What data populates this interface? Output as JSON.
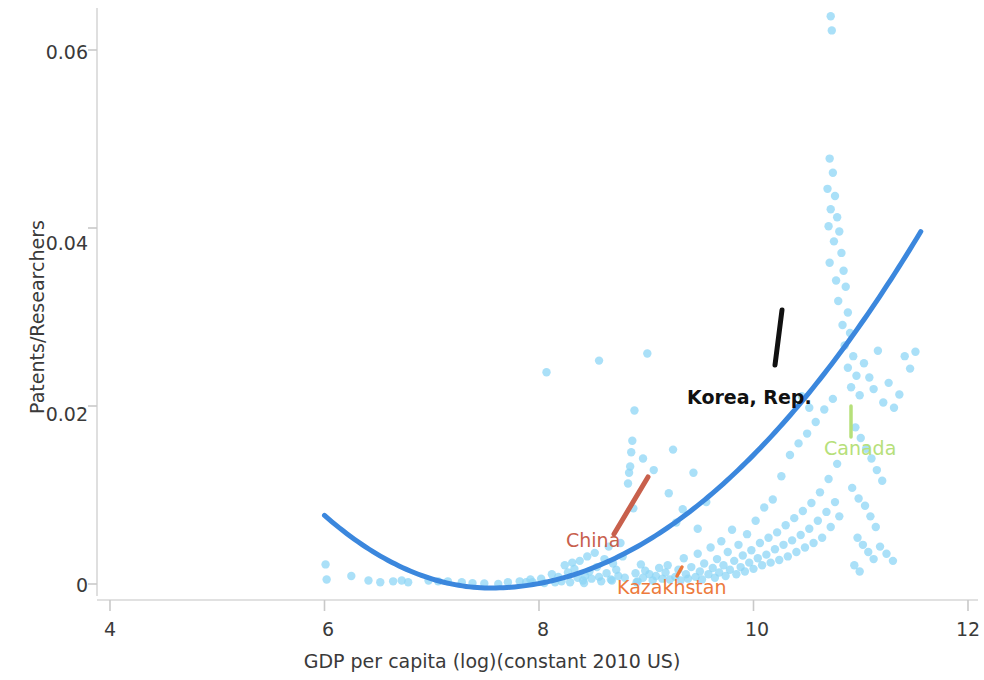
{
  "chart_data": {
    "type": "scatter",
    "title": "",
    "xlabel": "GDP per capita (log)(constant 2010 US)",
    "ylabel": "Patents/Researchers",
    "xlim": [
      4,
      12
    ],
    "ylim": [
      -0.0035,
      0.0665
    ],
    "xticks": [
      4,
      6,
      8,
      10,
      12
    ],
    "xtick_labels": [
      "4",
      "6",
      "8",
      "10",
      "12"
    ],
    "yticks": [
      0,
      0.02,
      0.04,
      0.06
    ],
    "ytick_labels": [
      "0",
      "0.02",
      "0.04",
      "0.06"
    ],
    "grid": false,
    "legend": "none",
    "point_color": "#8ed6f5",
    "point_opacity": 0.75,
    "point_radius": 4.2,
    "trend_color": "#3b87dd",
    "trend_width": 5,
    "points": [
      [
        6.01,
        0.0022
      ],
      [
        6.02,
        0.0005
      ],
      [
        6.52,
        0.0002
      ],
      [
        6.64,
        0.0003
      ],
      [
        6.72,
        0.0004
      ],
      [
        6.78,
        0.0002
      ],
      [
        6.97,
        0.0004
      ],
      [
        7.06,
        0.0003
      ],
      [
        7.28,
        0.0002
      ],
      [
        7.38,
        0.0001
      ],
      [
        7.49,
        5e-05
      ],
      [
        7.62,
        0.0
      ],
      [
        7.71,
        0.0002
      ],
      [
        7.82,
        0.0003
      ],
      [
        7.88,
        0.0002
      ],
      [
        7.94,
        0.0002
      ],
      [
        8.02,
        0.0006
      ],
      [
        8.05,
        0.0001
      ],
      [
        8.12,
        0.0011
      ],
      [
        8.18,
        0.0008
      ],
      [
        8.21,
        0.0003
      ],
      [
        8.24,
        0.0021
      ],
      [
        8.27,
        0.0013
      ],
      [
        8.29,
        0.0002
      ],
      [
        8.31,
        0.0024
      ],
      [
        8.33,
        0.0017
      ],
      [
        8.36,
        0.0007
      ],
      [
        8.38,
        0.0026
      ],
      [
        8.41,
        0.0004
      ],
      [
        8.43,
        0.0009
      ],
      [
        8.45,
        0.0031
      ],
      [
        8.47,
        0.0014
      ],
      [
        8.49,
        0.0006
      ],
      [
        8.52,
        0.0035
      ],
      [
        8.54,
        0.0019
      ],
      [
        8.56,
        0.0008
      ],
      [
        8.58,
        0.0003
      ],
      [
        8.61,
        0.0028
      ],
      [
        8.63,
        0.0012
      ],
      [
        8.65,
        0.0042
      ],
      [
        8.67,
        0.0005
      ],
      [
        8.69,
        0.0023
      ],
      [
        8.72,
        0.0016
      ],
      [
        8.74,
        0.0009
      ],
      [
        8.76,
        0.0046
      ],
      [
        8.78,
        0.0031
      ],
      [
        8.8,
        0.0007
      ],
      [
        8.83,
        0.0113
      ],
      [
        8.84,
        0.0125
      ],
      [
        8.85,
        0.0132
      ],
      [
        8.86,
        0.0148
      ],
      [
        8.87,
        0.0161
      ],
      [
        8.88,
        0.0085
      ],
      [
        8.89,
        0.0195
      ],
      [
        8.9,
        0.0012
      ],
      [
        8.92,
        0.0003
      ],
      [
        8.95,
        0.0022
      ],
      [
        8.97,
        0.0007
      ],
      [
        8.99,
        0.0015
      ],
      [
        9.01,
        0.0259
      ],
      [
        9.03,
        0.0011
      ],
      [
        9.06,
        0.0004
      ],
      [
        9.09,
        0.0009
      ],
      [
        9.12,
        0.0018
      ],
      [
        9.15,
        0.0006
      ],
      [
        9.18,
        0.0013
      ],
      [
        9.2,
        0.0021
      ],
      [
        9.22,
        0.0005
      ],
      [
        9.25,
        0.0151
      ],
      [
        9.27,
        0.0008
      ],
      [
        9.3,
        0.0016
      ],
      [
        9.32,
        0.0004
      ],
      [
        9.35,
        0.0029
      ],
      [
        9.37,
        0.0011
      ],
      [
        9.39,
        0.0006
      ],
      [
        9.42,
        0.0019
      ],
      [
        9.44,
        0.0125
      ],
      [
        9.46,
        0.0008
      ],
      [
        9.48,
        0.0034
      ],
      [
        9.5,
        0.0014
      ],
      [
        9.52,
        0.0005
      ],
      [
        9.54,
        0.0023
      ],
      [
        9.56,
        0.0092
      ],
      [
        9.58,
        0.0011
      ],
      [
        9.6,
        0.0041
      ],
      [
        9.62,
        0.0018
      ],
      [
        9.64,
        0.0007
      ],
      [
        9.66,
        0.0028
      ],
      [
        9.68,
        0.0013
      ],
      [
        9.7,
        0.0048
      ],
      [
        9.72,
        0.0021
      ],
      [
        9.74,
        0.0009
      ],
      [
        9.76,
        0.0036
      ],
      [
        9.78,
        0.0016
      ],
      [
        9.8,
        0.0061
      ],
      [
        9.82,
        0.0026
      ],
      [
        9.84,
        0.0011
      ],
      [
        9.86,
        0.0044
      ],
      [
        9.88,
        0.0019
      ],
      [
        9.9,
        0.0032
      ],
      [
        9.92,
        0.0014
      ],
      [
        9.94,
        0.0056
      ],
      [
        9.96,
        0.0024
      ],
      [
        9.98,
        0.0038
      ],
      [
        10.0,
        0.0017
      ],
      [
        10.02,
        0.0071
      ],
      [
        10.04,
        0.0029
      ],
      [
        10.06,
        0.0046
      ],
      [
        10.08,
        0.0021
      ],
      [
        10.1,
        0.0086
      ],
      [
        10.12,
        0.0033
      ],
      [
        10.14,
        0.0052
      ],
      [
        10.16,
        0.0024
      ],
      [
        10.18,
        0.0095
      ],
      [
        10.2,
        0.0039
      ],
      [
        10.22,
        0.0058
      ],
      [
        10.24,
        0.0027
      ],
      [
        10.26,
        0.0121
      ],
      [
        10.28,
        0.0044
      ],
      [
        10.3,
        0.0066
      ],
      [
        10.32,
        0.0031
      ],
      [
        10.34,
        0.0145
      ],
      [
        10.36,
        0.0049
      ],
      [
        10.38,
        0.0074
      ],
      [
        10.4,
        0.0036
      ],
      [
        10.42,
        0.0158
      ],
      [
        10.44,
        0.0055
      ],
      [
        10.46,
        0.0082
      ],
      [
        10.48,
        0.0041
      ],
      [
        10.5,
        0.0169
      ],
      [
        10.52,
        0.0062
      ],
      [
        10.54,
        0.0091
      ],
      [
        10.56,
        0.0046
      ],
      [
        10.58,
        0.0182
      ],
      [
        10.6,
        0.0071
      ],
      [
        10.62,
        0.0103
      ],
      [
        10.64,
        0.0052
      ],
      [
        10.66,
        0.0196
      ],
      [
        10.68,
        0.0081
      ],
      [
        10.7,
        0.0118
      ],
      [
        10.72,
        0.0064
      ],
      [
        10.74,
        0.0208
      ],
      [
        10.76,
        0.0092
      ],
      [
        10.78,
        0.0135
      ],
      [
        10.8,
        0.0076
      ],
      [
        10.72,
        0.0638
      ],
      [
        10.73,
        0.0622
      ],
      [
        10.71,
        0.0478
      ],
      [
        10.74,
        0.0462
      ],
      [
        10.69,
        0.0444
      ],
      [
        10.76,
        0.0436
      ],
      [
        10.72,
        0.0421
      ],
      [
        10.78,
        0.0412
      ],
      [
        10.7,
        0.0402
      ],
      [
        10.8,
        0.0396
      ],
      [
        10.75,
        0.0385
      ],
      [
        10.82,
        0.0372
      ],
      [
        10.71,
        0.0361
      ],
      [
        10.84,
        0.0352
      ],
      [
        10.77,
        0.0341
      ],
      [
        10.86,
        0.0334
      ],
      [
        10.79,
        0.0318
      ],
      [
        10.88,
        0.0305
      ],
      [
        10.83,
        0.0291
      ],
      [
        10.9,
        0.0282
      ],
      [
        10.85,
        0.0268
      ],
      [
        10.93,
        0.0256
      ],
      [
        10.88,
        0.0243
      ],
      [
        10.96,
        0.0234
      ],
      [
        10.91,
        0.0221
      ],
      [
        10.99,
        0.0212
      ],
      [
        11.03,
        0.0248
      ],
      [
        11.08,
        0.0232
      ],
      [
        11.12,
        0.0219
      ],
      [
        11.16,
        0.0262
      ],
      [
        11.21,
        0.0204
      ],
      [
        11.26,
        0.0226
      ],
      [
        11.31,
        0.0198
      ],
      [
        11.36,
        0.0213
      ],
      [
        11.41,
        0.0256
      ],
      [
        11.46,
        0.0242
      ],
      [
        11.51,
        0.0261
      ],
      [
        10.95,
        0.0176
      ],
      [
        11.0,
        0.0164
      ],
      [
        11.05,
        0.0152
      ],
      [
        11.1,
        0.0141
      ],
      [
        11.15,
        0.0128
      ],
      [
        11.2,
        0.0116
      ],
      [
        10.92,
        0.0108
      ],
      [
        10.98,
        0.0096
      ],
      [
        11.04,
        0.0088
      ],
      [
        11.09,
        0.0076
      ],
      [
        11.14,
        0.0064
      ],
      [
        10.97,
        0.0052
      ],
      [
        11.02,
        0.0044
      ],
      [
        11.07,
        0.0036
      ],
      [
        11.12,
        0.0028
      ],
      [
        10.94,
        0.0021
      ],
      [
        10.99,
        0.0014
      ],
      [
        11.18,
        0.0042
      ],
      [
        11.24,
        0.0034
      ],
      [
        11.3,
        0.0026
      ],
      [
        8.07,
        0.0238
      ],
      [
        8.56,
        0.0251
      ],
      [
        9.34,
        0.0084
      ],
      [
        9.48,
        0.0062
      ],
      [
        9.28,
        0.0069
      ],
      [
        9.21,
        0.0102
      ],
      [
        9.07,
        0.0128
      ],
      [
        8.97,
        0.0141
      ],
      [
        10.45,
        0.0211
      ],
      [
        10.52,
        0.0198
      ],
      [
        6.25,
        0.0009
      ],
      [
        6.41,
        0.0004
      ],
      [
        7.15,
        0.0003
      ],
      [
        7.92,
        0.0005
      ],
      [
        8.15,
        0.0002
      ],
      [
        8.42,
        0.0001
      ],
      [
        8.68,
        0.0004
      ],
      [
        8.91,
        0.0002
      ]
    ],
    "trend_curve": {
      "description": "fitted quadratic trend line",
      "x_start": 6.0,
      "x_end": 11.56,
      "y_start": 0.0077,
      "y_min": -0.00045,
      "x_min": 7.55,
      "y_end": 0.0396,
      "color": "#3b87dd"
    },
    "annotations": [
      {
        "name": "China",
        "label": "China",
        "color": "#c8604c",
        "label_x": 566,
        "label_y": 529,
        "line": {
          "x1": 614,
          "y1": 534,
          "x2": 648,
          "y2": 477
        }
      },
      {
        "name": "Kazakhstan",
        "label": "Kazakhstan",
        "color": "#ed7a3c",
        "label_x": 617,
        "label_y": 576,
        "line": {
          "x1": 677,
          "y1": 576,
          "x2": 682,
          "y2": 567
        }
      },
      {
        "name": "Korea, Rep.",
        "label": "Korea, Rep.",
        "color": "#111111",
        "label_x": 687,
        "label_y": 386,
        "line": {
          "x1": 775,
          "y1": 365,
          "x2": 782,
          "y2": 310
        }
      },
      {
        "name": "Canada",
        "label": "Canada",
        "color": "#b6e07a",
        "label_x": 824,
        "label_y": 437,
        "line": {
          "x1": 851,
          "y1": 437,
          "x2": 851,
          "y2": 406
        }
      }
    ]
  },
  "axes": {
    "x_title": "GDP per capita (log)(constant 2010 US)",
    "y_title": "Patents/Researchers",
    "x_tick_labels": [
      "4",
      "6",
      "8",
      "10",
      "12"
    ],
    "y_tick_labels": [
      "0",
      "0.02",
      "0.04",
      "0.06"
    ]
  }
}
